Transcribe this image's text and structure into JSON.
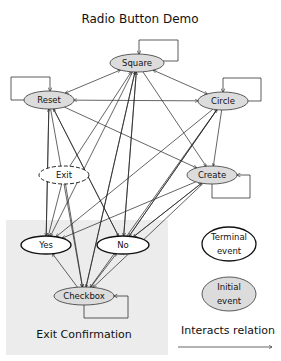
{
  "title": "Radio Button Demo",
  "colors": {
    "initial_fill": "#dcdcdc",
    "terminal_fill": "#ffffff",
    "region_fill": "#ececec",
    "stroke": "#111111"
  },
  "nodes": [
    {
      "id": "square",
      "label": "Square",
      "type": "initial",
      "cx": 137,
      "cy": 63,
      "rx": 27,
      "ry": 9,
      "self_loop": true
    },
    {
      "id": "reset",
      "label": "Reset",
      "type": "initial",
      "cx": 49,
      "cy": 100,
      "rx": 25,
      "ry": 9,
      "self_loop": true
    },
    {
      "id": "circle",
      "label": "Circle",
      "type": "initial",
      "cx": 223,
      "cy": 101,
      "rx": 25,
      "ry": 9,
      "self_loop": true
    },
    {
      "id": "exit",
      "label": "Exit",
      "type": "dashed",
      "cx": 64,
      "cy": 175,
      "rx": 25,
      "ry": 9,
      "self_loop": false
    },
    {
      "id": "create",
      "label": "Create",
      "type": "initial",
      "cx": 212,
      "cy": 175,
      "rx": 25,
      "ry": 9,
      "self_loop": true
    },
    {
      "id": "yes",
      "label": "Yes",
      "type": "terminal",
      "cx": 46,
      "cy": 245,
      "rx": 25,
      "ry": 9,
      "self_loop": false
    },
    {
      "id": "no",
      "label": "No",
      "type": "terminal",
      "cx": 123,
      "cy": 245,
      "rx": 26,
      "ry": 9,
      "self_loop": false
    },
    {
      "id": "checkbox",
      "label": "Checkbox",
      "type": "initial",
      "cx": 84,
      "cy": 296,
      "rx": 30,
      "ry": 9,
      "self_loop": true
    }
  ],
  "region": {
    "label": "Exit Confirmation"
  },
  "legend": {
    "terminal": {
      "line1": "Terminal",
      "line2": "event"
    },
    "initial": {
      "line1": "Initial",
      "line2": "event"
    },
    "relation": "Interacts relation"
  },
  "edges": [
    [
      "square",
      "reset",
      "both"
    ],
    [
      "square",
      "circle",
      "both"
    ],
    [
      "reset",
      "circle",
      "both"
    ],
    [
      "reset",
      "create",
      "to"
    ],
    [
      "circle",
      "create",
      "to"
    ],
    [
      "square",
      "create",
      "to"
    ],
    [
      "reset",
      "yes",
      "to"
    ],
    [
      "reset",
      "no",
      "to"
    ],
    [
      "reset",
      "checkbox",
      "to"
    ],
    [
      "square",
      "yes",
      "to"
    ],
    [
      "square",
      "no",
      "to"
    ],
    [
      "square",
      "checkbox",
      "to"
    ],
    [
      "circle",
      "yes",
      "to"
    ],
    [
      "circle",
      "no",
      "to"
    ],
    [
      "circle",
      "checkbox",
      "to"
    ],
    [
      "create",
      "yes",
      "to"
    ],
    [
      "create",
      "no",
      "to"
    ],
    [
      "create",
      "checkbox",
      "to"
    ],
    [
      "exit",
      "square",
      "to"
    ],
    [
      "exit",
      "yes",
      "to"
    ],
    [
      "exit",
      "checkbox",
      "to"
    ],
    [
      "yes",
      "reset",
      "to"
    ],
    [
      "no",
      "square",
      "to"
    ],
    [
      "no",
      "reset",
      "to"
    ],
    [
      "no",
      "circle",
      "to"
    ],
    [
      "no",
      "create",
      "to"
    ],
    [
      "checkbox",
      "yes",
      "to"
    ],
    [
      "checkbox",
      "no",
      "to"
    ],
    [
      "checkbox",
      "square",
      "to"
    ]
  ]
}
